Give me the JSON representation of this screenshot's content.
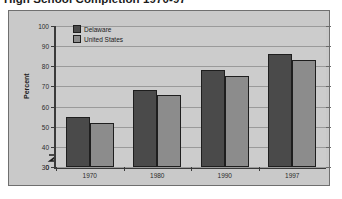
{
  "chart_data": {
    "type": "bar",
    "title": "High School Completion 1970-97",
    "xlabel": "",
    "ylabel": "Percent",
    "categories": [
      "1970",
      "1980",
      "1990",
      "1997"
    ],
    "series": [
      {
        "name": "Delaware",
        "color": "#4a4a4a",
        "values": [
          55,
          68,
          78,
          86
        ]
      },
      {
        "name": "United States",
        "color": "#8c8c8c",
        "values": [
          52,
          66,
          75,
          83
        ]
      }
    ],
    "ylim": [
      30,
      100
    ],
    "yticks": [
      "100",
      "90",
      "80",
      "70",
      "60",
      "50",
      "40",
      "30",
      "0"
    ],
    "axis_break": true,
    "grid": true,
    "legend_position": "top-left"
  },
  "legend": {
    "items": [
      {
        "label": "Delaware"
      },
      {
        "label": "United States"
      }
    ]
  },
  "icons": {
    "axis_break": "axis-break-zigzag"
  }
}
